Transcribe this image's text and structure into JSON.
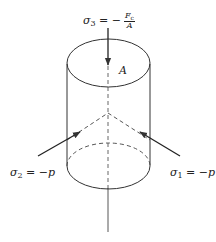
{
  "figure": {
    "colors": {
      "stroke": "#333333",
      "text": "#222222",
      "background": "#ffffff"
    },
    "labels": {
      "sigma3": {
        "symbol": "σ",
        "sub": "3",
        "eq": " = −",
        "num": "F",
        "num_sub": "c",
        "den": "A"
      },
      "area": "A",
      "sigma2": {
        "symbol": "σ",
        "sub": "2",
        "eq": " = −p"
      },
      "sigma1": {
        "symbol": "σ",
        "sub": "1",
        "eq": " = −p"
      }
    },
    "arrows": [
      {
        "name": "sigma3-arrow",
        "direction": "down",
        "from": [
          108,
          28
        ],
        "to": [
          108,
          66
        ]
      },
      {
        "name": "sigma2-arrow",
        "direction": "up-right",
        "from": [
          38,
          156
        ],
        "to": [
          80,
          132
        ]
      },
      {
        "name": "sigma1-arrow",
        "direction": "up-left",
        "from": [
          180,
          156
        ],
        "to": [
          140,
          132
        ]
      }
    ]
  }
}
